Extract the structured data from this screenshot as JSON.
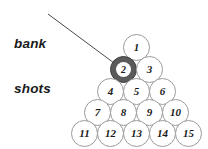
{
  "figure": {
    "background_color": "#ffffff"
  },
  "annotation": {
    "name": "bank-shots-callout",
    "line1": "bank",
    "line2": "shots",
    "text_color": "#1a1a1a",
    "leader_line": {
      "color": "#4a4a4a",
      "from_x": 48,
      "from_y": 14,
      "to_x": 114,
      "to_y": 63
    }
  },
  "rack": {
    "ball_diameter": 27,
    "default_fill": "#ffffff",
    "default_stroke": "#9a9a9a",
    "highlight_fill": "#5a5a5a",
    "highlight_stroke": "#3d3d3d",
    "balls": [
      {
        "number": "1",
        "x": 123,
        "y": 34,
        "highlighted": false
      },
      {
        "number": "2",
        "x": 110,
        "y": 56,
        "highlighted": true
      },
      {
        "number": "3",
        "x": 136,
        "y": 56,
        "highlighted": false
      },
      {
        "number": "4",
        "x": 97,
        "y": 78,
        "highlighted": false
      },
      {
        "number": "5",
        "x": 123,
        "y": 78,
        "highlighted": false
      },
      {
        "number": "6",
        "x": 149,
        "y": 78,
        "highlighted": false
      },
      {
        "number": "7",
        "x": 84,
        "y": 99,
        "highlighted": false
      },
      {
        "number": "8",
        "x": 110,
        "y": 99,
        "highlighted": false
      },
      {
        "number": "9",
        "x": 136,
        "y": 99,
        "highlighted": false
      },
      {
        "number": "10",
        "x": 162,
        "y": 99,
        "highlighted": false
      },
      {
        "number": "11",
        "x": 71,
        "y": 120,
        "highlighted": false
      },
      {
        "number": "12",
        "x": 97,
        "y": 120,
        "highlighted": false
      },
      {
        "number": "13",
        "x": 123,
        "y": 120,
        "highlighted": false
      },
      {
        "number": "14",
        "x": 149,
        "y": 120,
        "highlighted": false
      },
      {
        "number": "15",
        "x": 175,
        "y": 120,
        "highlighted": false
      }
    ]
  }
}
